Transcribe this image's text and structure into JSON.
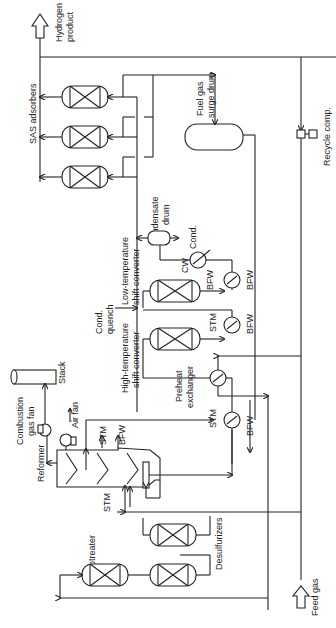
{
  "diagram": {
    "orientation": "rotated 90 degrees counterclockwise",
    "colors": {
      "line": "#222222",
      "background": "#ffffff"
    },
    "labels": {
      "hydrogen_product_1": "Hydrogen",
      "hydrogen_product_2": "product",
      "sas_adsorbers": "SAS adsorbers",
      "fuel_gas_1": "Fuel gas",
      "fuel_gas_2": "surge drum",
      "recycle_comp": "Recycle comp.",
      "condensate_1": "Condensate",
      "condensate_2": "drum",
      "cond": "Cond.",
      "cw": "CW",
      "bfw_lt_1": "BFW",
      "bfw_lt_2": "BFW",
      "lt_shift_1": "Low-temperature",
      "lt_shift_2": "shift converter",
      "cond_quench_1": "Cond.",
      "cond_quench_2": "quench",
      "stm_ht": "STM",
      "bfw_ht": "BFW",
      "ht_shift_1": "High-temperature",
      "ht_shift_2": "shift converter",
      "preheat_1": "Preheat",
      "preheat_2": "exchanger",
      "stm_pre": "STM",
      "bfw_pre": "BFW",
      "combustion_1": "Combustion",
      "combustion_2": "gas fan",
      "stack": "Stack",
      "air_fan": "Air fan",
      "reformer": "Reformer",
      "stm_ref": "STM",
      "bfw_ref": "BFW",
      "stm_feed": "STM",
      "hydrotreater": "Hydrotreater",
      "desulfurizers": "Desulfurizers",
      "feed_gas": "Feed gas"
    },
    "equipment": [
      "SAS adsorbers (3)",
      "Fuel gas surge drum",
      "Recycle compressor",
      "Condensate drum",
      "Low-temperature shift converter",
      "High-temperature shift converter",
      "Preheat exchanger",
      "Reformer",
      "Combustion gas fan",
      "Air fan",
      "Stack",
      "Hydrotreater",
      "Desulfurizers (2)"
    ],
    "streams": [
      "Feed gas",
      "Hydrogen product",
      "STM",
      "BFW",
      "CW",
      "Cond.",
      "Cond. quench"
    ]
  }
}
